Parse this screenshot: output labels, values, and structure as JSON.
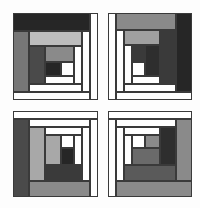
{
  "image": {
    "description": "Four log-cabin quilt blocks arranged in a 2x2 grid, grayscale",
    "width": 200,
    "height": 208
  },
  "colors": {
    "white": "#ffffff",
    "light_gray": "#bdbdbd",
    "mid_gray": "#8a8a8a",
    "gray": "#777777",
    "dark_gray": "#4a4a4a",
    "very_dark": "#262626",
    "outline": "#3a3a3a"
  },
  "quadrants": [
    {
      "name": "top-left",
      "frame": [
        13,
        13,
        85,
        87
      ],
      "blocks": [
        {
          "x": 13,
          "y": 13,
          "w": 77,
          "h": 18,
          "fill": "#262626"
        },
        {
          "x": 90,
          "y": 13,
          "w": 8,
          "h": 87,
          "fill": "#ffffff"
        },
        {
          "x": 13,
          "y": 92,
          "w": 77,
          "h": 8,
          "fill": "#ffffff"
        },
        {
          "x": 13,
          "y": 31,
          "w": 16,
          "h": 61,
          "fill": "#777777"
        },
        {
          "x": 82,
          "y": 31,
          "w": 8,
          "h": 61,
          "fill": "#ffffff"
        },
        {
          "x": 29,
          "y": 84,
          "w": 53,
          "h": 8,
          "fill": "#ffffff"
        },
        {
          "x": 29,
          "y": 31,
          "w": 53,
          "h": 15,
          "fill": "#bdbdbd"
        },
        {
          "x": 29,
          "y": 46,
          "w": 16,
          "h": 38,
          "fill": "#4a4a4a"
        },
        {
          "x": 74,
          "y": 46,
          "w": 8,
          "h": 38,
          "fill": "#ffffff"
        },
        {
          "x": 45,
          "y": 76,
          "w": 29,
          "h": 8,
          "fill": "#ffffff"
        },
        {
          "x": 45,
          "y": 46,
          "w": 29,
          "h": 16,
          "fill": "#8a8a8a"
        },
        {
          "x": 45,
          "y": 62,
          "w": 16,
          "h": 14,
          "fill": "#262626"
        },
        {
          "x": 61,
          "y": 62,
          "w": 13,
          "h": 14,
          "fill": "#ffffff"
        }
      ]
    },
    {
      "name": "top-right",
      "frame": [
        108,
        13,
        84,
        87
      ],
      "blocks": [
        {
          "x": 108,
          "y": 13,
          "w": 8,
          "h": 87,
          "fill": "#ffffff"
        },
        {
          "x": 116,
          "y": 13,
          "w": 60,
          "h": 17,
          "fill": "#8a8a8a"
        },
        {
          "x": 176,
          "y": 13,
          "w": 16,
          "h": 79,
          "fill": "#262626"
        },
        {
          "x": 116,
          "y": 92,
          "w": 76,
          "h": 8,
          "fill": "#ffffff"
        },
        {
          "x": 116,
          "y": 30,
          "w": 8,
          "h": 62,
          "fill": "#ffffff"
        },
        {
          "x": 124,
          "y": 30,
          "w": 36,
          "h": 15,
          "fill": "#a0a0a0"
        },
        {
          "x": 160,
          "y": 30,
          "w": 16,
          "h": 54,
          "fill": "#3a3a3a"
        },
        {
          "x": 124,
          "y": 84,
          "w": 52,
          "h": 8,
          "fill": "#ffffff"
        },
        {
          "x": 124,
          "y": 45,
          "w": 8,
          "h": 39,
          "fill": "#ffffff"
        },
        {
          "x": 132,
          "y": 76,
          "w": 28,
          "h": 8,
          "fill": "#ffffff"
        },
        {
          "x": 132,
          "y": 45,
          "w": 13,
          "h": 17,
          "fill": "#3a3a3a"
        },
        {
          "x": 145,
          "y": 45,
          "w": 15,
          "h": 31,
          "fill": "#2e2e2e"
        },
        {
          "x": 132,
          "y": 62,
          "w": 13,
          "h": 14,
          "fill": "#ffffff"
        }
      ]
    },
    {
      "name": "bottom-left",
      "frame": [
        13,
        111,
        85,
        86
      ],
      "blocks": [
        {
          "x": 13,
          "y": 111,
          "w": 85,
          "h": 8,
          "fill": "#ffffff"
        },
        {
          "x": 90,
          "y": 119,
          "w": 8,
          "h": 78,
          "fill": "#ffffff"
        },
        {
          "x": 13,
          "y": 119,
          "w": 16,
          "h": 78,
          "fill": "#4a4a4a"
        },
        {
          "x": 29,
          "y": 181,
          "w": 61,
          "h": 16,
          "fill": "#8a8a8a"
        },
        {
          "x": 29,
          "y": 119,
          "w": 61,
          "h": 8,
          "fill": "#ffffff"
        },
        {
          "x": 82,
          "y": 127,
          "w": 8,
          "h": 54,
          "fill": "#ffffff"
        },
        {
          "x": 29,
          "y": 127,
          "w": 16,
          "h": 54,
          "fill": "#a8a8a8"
        },
        {
          "x": 45,
          "y": 165,
          "w": 37,
          "h": 16,
          "fill": "#3a3a3a"
        },
        {
          "x": 45,
          "y": 127,
          "w": 37,
          "h": 8,
          "fill": "#ffffff"
        },
        {
          "x": 74,
          "y": 135,
          "w": 8,
          "h": 30,
          "fill": "#ffffff"
        },
        {
          "x": 45,
          "y": 135,
          "w": 16,
          "h": 30,
          "fill": "#a8a8a8"
        },
        {
          "x": 61,
          "y": 148,
          "w": 13,
          "h": 17,
          "fill": "#262626"
        },
        {
          "x": 61,
          "y": 135,
          "w": 13,
          "h": 13,
          "fill": "#ffffff"
        }
      ]
    },
    {
      "name": "bottom-right",
      "frame": [
        108,
        111,
        84,
        86
      ],
      "blocks": [
        {
          "x": 108,
          "y": 111,
          "w": 84,
          "h": 8,
          "fill": "#ffffff"
        },
        {
          "x": 108,
          "y": 119,
          "w": 8,
          "h": 78,
          "fill": "#ffffff"
        },
        {
          "x": 176,
          "y": 119,
          "w": 16,
          "h": 62,
          "fill": "#8a8a8a"
        },
        {
          "x": 116,
          "y": 181,
          "w": 76,
          "h": 16,
          "fill": "#8a8a8a"
        },
        {
          "x": 116,
          "y": 119,
          "w": 60,
          "h": 8,
          "fill": "#ffffff"
        },
        {
          "x": 116,
          "y": 127,
          "w": 8,
          "h": 54,
          "fill": "#ffffff"
        },
        {
          "x": 160,
          "y": 127,
          "w": 16,
          "h": 38,
          "fill": "#2e2e2e"
        },
        {
          "x": 124,
          "y": 165,
          "w": 52,
          "h": 16,
          "fill": "#5a5a5a"
        },
        {
          "x": 124,
          "y": 127,
          "w": 36,
          "h": 8,
          "fill": "#ffffff"
        },
        {
          "x": 124,
          "y": 135,
          "w": 8,
          "h": 30,
          "fill": "#ffffff"
        },
        {
          "x": 132,
          "y": 148,
          "w": 28,
          "h": 17,
          "fill": "#6a6a6a"
        },
        {
          "x": 132,
          "y": 135,
          "w": 13,
          "h": 13,
          "fill": "#ffffff"
        },
        {
          "x": 145,
          "y": 135,
          "w": 15,
          "h": 13,
          "fill": "#8a8a8a"
        }
      ]
    }
  ]
}
